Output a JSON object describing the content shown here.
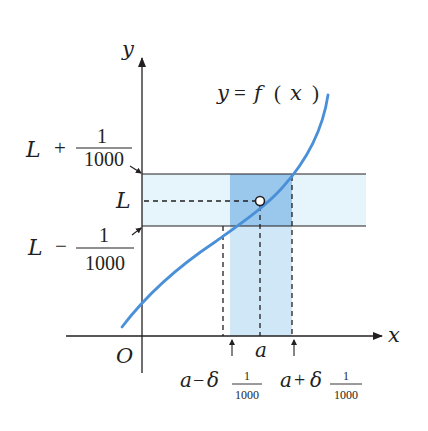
{
  "diagram": {
    "type": "epsilon-delta limit illustration",
    "curve_label": "y = f ( x )",
    "curve_label_parts": {
      "y": "y",
      "eq": "=",
      "f": "f",
      "lp": "(",
      "x": "x",
      "rp": ")"
    },
    "axes": {
      "x_label": "x",
      "y_label": "y",
      "origin_label": "O"
    },
    "y_labels": {
      "upper": {
        "var": "L",
        "op": "+",
        "num": "1",
        "den": "1000"
      },
      "mid": {
        "var": "L"
      },
      "lower": {
        "var": "L",
        "op": "−",
        "num": "1",
        "den": "1000"
      }
    },
    "x_labels": {
      "a": "a",
      "left": {
        "var": "a",
        "op": "−",
        "delta": "δ",
        "num": "1",
        "den": "1000"
      },
      "right": {
        "var": "a",
        "op": "+",
        "delta": "δ",
        "num": "1",
        "den": "1000"
      }
    },
    "colors": {
      "curve": "#4a90d9",
      "band_light": "#e6f4fb",
      "band_dark": "#a9d3f0",
      "axis": "#231f20"
    }
  }
}
